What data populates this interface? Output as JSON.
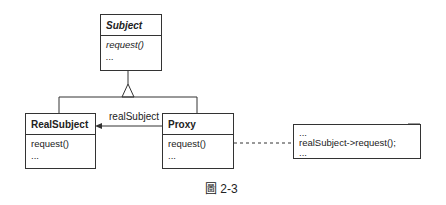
{
  "diagram": {
    "type": "UML class diagram",
    "pattern": "Proxy",
    "classes": [
      {
        "id": "subject",
        "name": "Subject",
        "abstract": true,
        "operations": [
          "request()",
          "..."
        ]
      },
      {
        "id": "real_subject",
        "name": "RealSubject",
        "abstract": false,
        "operations": [
          "request()",
          "..."
        ]
      },
      {
        "id": "proxy",
        "name": "Proxy",
        "abstract": false,
        "operations": [
          "request()",
          "..."
        ]
      }
    ],
    "relations": [
      {
        "type": "inheritance",
        "from": "RealSubject",
        "to": "Subject"
      },
      {
        "type": "inheritance",
        "from": "Proxy",
        "to": "Subject"
      },
      {
        "type": "association",
        "from": "Proxy",
        "to": "RealSubject",
        "label": "realSubject"
      },
      {
        "type": "note-link",
        "from": "Proxy.request()",
        "to": "note"
      }
    ],
    "association_label": "realSubject",
    "note": {
      "lines": [
        "...",
        "realSubject->request();",
        "..."
      ]
    },
    "caption": "圖 2-3"
  }
}
